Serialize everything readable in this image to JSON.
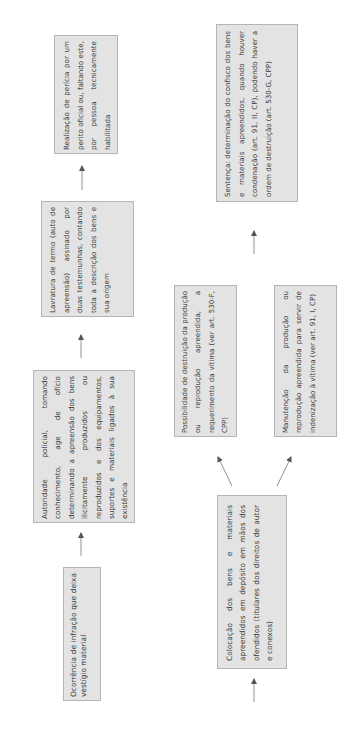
{
  "diagram": {
    "orientation": "rotated-90-ccw",
    "colors": {
      "box_fill": "#e3e3e3",
      "box_border": "#b5b5b5",
      "text": "#3a3a3a",
      "arrow": "#555555"
    },
    "nodes": {
      "ocorrencia": {
        "text": "Ocorrência de infração que deixa vestígio material"
      },
      "autoridade": {
        "text": "Autoridade policial, tomando conhecimento, age de ofício determinando a apreensão dos bens ilicitamente produzidos ou reproduzidos e dos equipamentos, suportes e materiais ligados à sua existência"
      },
      "lavratura": {
        "text": "Lavratura de termo (auto de apreensão) assinado por duas testemunhas, contando toda a descrição dos bens e sua origem"
      },
      "realizacao": {
        "text": "Realização de perícia por um perito oficial ou, faltando este, por pessoa tecnicamente habilitada"
      },
      "colocacao": {
        "text": "Colocação dos bens e materiais apreendidos em depósito em mãos dos ofendidos (titulares dos direitos de autor e conexos)"
      },
      "possibilidade": {
        "text": "Possibilidade de destruição da produção ou reprodução apreendida, a requerimento da vítima (ver art. 530-F, CPP)"
      },
      "manutencao": {
        "text": "Manutenção da produção ou reprodução apreendida para servir de indenização à vítima (ver art. 91, I, CP)"
      },
      "sentenca": {
        "text": "Sentença: determinação do confisco dos bens e materiais apreendidos, quando houver condenação (art. 91, II, CP), podendo haver a ordem de destruição (art. 530-G, CPP)"
      }
    },
    "edges": [
      {
        "from": "ocorrencia",
        "to": "autoridade"
      },
      {
        "from": "autoridade",
        "to": "lavratura"
      },
      {
        "from": "lavratura",
        "to": "realizacao"
      },
      {
        "from": "colocacao",
        "to": "possibilidade"
      },
      {
        "from": "colocacao",
        "to": "manutencao"
      },
      {
        "from": "manutencao",
        "to": "sentenca"
      }
    ]
  }
}
